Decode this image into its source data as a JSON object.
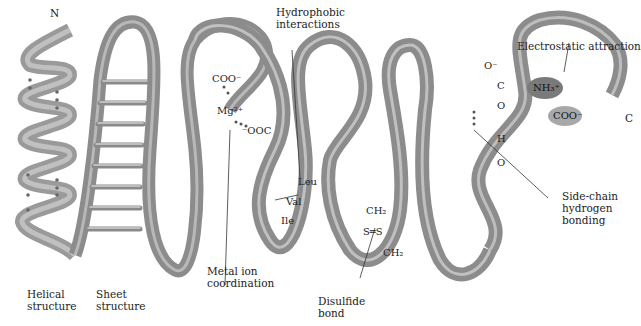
{
  "diagram": {
    "terminals": {
      "n": "N",
      "c": "C"
    },
    "labels": {
      "helical": "Helical\nstructure",
      "sheet": "Sheet\nstructure",
      "metal_ion": "Metal ion\ncoordination",
      "hydrophobic": "Hydrophobic\ninteractions",
      "disulfide": "Disulfide\nbond",
      "electrostatic": "Electrostatic attraction",
      "hbond": "Side-chain\nhydrogen\nbonding"
    },
    "chem": {
      "coo_top": "COO⁻",
      "mg": "Mg²⁺",
      "ooc": "⁻OOC",
      "leu": "Leu",
      "val": "Val",
      "ile": "Ile",
      "ch2_top": "CH₂",
      "ss": "S═S",
      "ch2_bottom": "CH₂",
      "o_minus": "O⁻",
      "c": "C",
      "o": "O",
      "h": "H",
      "o2": "O",
      "nh3": "NH₃⁺",
      "coo_ion": "COO⁻"
    },
    "colors": {
      "ribbon": "#9a9a9a",
      "ribbon_edge": "#6e6e6e",
      "ribbon_highlight": "#c8c8c8",
      "nh3_blob": "#7a7a7a",
      "coo_blob": "#a8a8a8",
      "text": "#222222"
    }
  }
}
